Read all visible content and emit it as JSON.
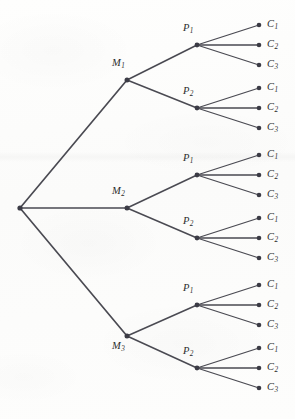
{
  "diagram": {
    "type": "probability-tree",
    "title": "",
    "background_color": "#fdfdfc",
    "line_color": "#4a4a52",
    "node_color": "#3b3b45",
    "label_color": "#2b2b2b",
    "levels": 3,
    "leaf_count": 18,
    "geometry": {
      "root": {
        "x": 20,
        "y": 208
      },
      "level_x": {
        "root": 20,
        "m": 127,
        "p": 197,
        "c": 259
      },
      "label_offset": {
        "c_label_x": 267
      }
    },
    "nodes": {
      "root": {
        "name": "root-node",
        "x": 20,
        "y": 208,
        "label": ""
      },
      "m_nodes": [
        {
          "name": "node-m1",
          "base": "M",
          "sub": "1",
          "x": 127,
          "y": 80,
          "label_x": 112,
          "label_y": 57,
          "label_pos": "above-left"
        },
        {
          "name": "node-m2",
          "base": "M",
          "sub": "2",
          "x": 127,
          "y": 208,
          "label_x": 112,
          "label_y": 185,
          "label_pos": "above-left"
        },
        {
          "name": "node-m3",
          "base": "M",
          "sub": "3",
          "x": 127,
          "y": 336,
          "label_x": 112,
          "label_y": 340,
          "label_pos": "below-left"
        }
      ],
      "p_nodes": [
        {
          "name": "node-m1-p1",
          "base": "P",
          "sub": "1",
          "x": 197,
          "y": 45,
          "parent": "node-m1",
          "label_x": 183,
          "label_y": 22
        },
        {
          "name": "node-m1-p2",
          "base": "P",
          "sub": "2",
          "x": 197,
          "y": 108,
          "parent": "node-m1",
          "label_x": 183,
          "label_y": 85
        },
        {
          "name": "node-m2-p1",
          "base": "P",
          "sub": "1",
          "x": 197,
          "y": 175,
          "parent": "node-m2",
          "label_x": 183,
          "label_y": 152
        },
        {
          "name": "node-m2-p2",
          "base": "P",
          "sub": "2",
          "x": 197,
          "y": 238,
          "parent": "node-m2",
          "label_x": 183,
          "label_y": 215
        },
        {
          "name": "node-m3-p1",
          "base": "P",
          "sub": "1",
          "x": 197,
          "y": 305,
          "parent": "node-m3",
          "label_x": 183,
          "label_y": 282
        },
        {
          "name": "node-m3-p2",
          "base": "P",
          "sub": "2",
          "x": 197,
          "y": 368,
          "parent": "node-m3",
          "label_x": 183,
          "label_y": 345
        }
      ],
      "c_nodes": [
        {
          "name": "leaf-m1-p1-c1",
          "base": "C",
          "sub": "1",
          "x": 259,
          "y": 25,
          "parent": "node-m1-p1"
        },
        {
          "name": "leaf-m1-p1-c2",
          "base": "C",
          "sub": "2",
          "x": 259,
          "y": 45,
          "parent": "node-m1-p1"
        },
        {
          "name": "leaf-m1-p1-c3",
          "base": "C",
          "sub": "3",
          "x": 259,
          "y": 65,
          "parent": "node-m1-p1"
        },
        {
          "name": "leaf-m1-p2-c1",
          "base": "C",
          "sub": "1",
          "x": 259,
          "y": 88,
          "parent": "node-m1-p2"
        },
        {
          "name": "leaf-m1-p2-c2",
          "base": "C",
          "sub": "2",
          "x": 259,
          "y": 108,
          "parent": "node-m1-p2"
        },
        {
          "name": "leaf-m1-p2-c3",
          "base": "C",
          "sub": "3",
          "x": 259,
          "y": 128,
          "parent": "node-m1-p2"
        },
        {
          "name": "leaf-m2-p1-c1",
          "base": "C",
          "sub": "1",
          "x": 259,
          "y": 155,
          "parent": "node-m2-p1"
        },
        {
          "name": "leaf-m2-p1-c2",
          "base": "C",
          "sub": "2",
          "x": 259,
          "y": 175,
          "parent": "node-m2-p1"
        },
        {
          "name": "leaf-m2-p1-c3",
          "base": "C",
          "sub": "3",
          "x": 259,
          "y": 195,
          "parent": "node-m2-p1"
        },
        {
          "name": "leaf-m2-p2-c1",
          "base": "C",
          "sub": "1",
          "x": 259,
          "y": 218,
          "parent": "node-m2-p2"
        },
        {
          "name": "leaf-m2-p2-c2",
          "base": "C",
          "sub": "2",
          "x": 259,
          "y": 238,
          "parent": "node-m2-p2"
        },
        {
          "name": "leaf-m2-p2-c3",
          "base": "C",
          "sub": "3",
          "x": 259,
          "y": 258,
          "parent": "node-m2-p2"
        },
        {
          "name": "leaf-m3-p1-c1",
          "base": "C",
          "sub": "1",
          "x": 259,
          "y": 285,
          "parent": "node-m3-p1"
        },
        {
          "name": "leaf-m3-p1-c2",
          "base": "C",
          "sub": "2",
          "x": 259,
          "y": 305,
          "parent": "node-m3-p1"
        },
        {
          "name": "leaf-m3-p1-c3",
          "base": "C",
          "sub": "3",
          "x": 259,
          "y": 325,
          "parent": "node-m3-p1"
        },
        {
          "name": "leaf-m3-p2-c1",
          "base": "C",
          "sub": "1",
          "x": 259,
          "y": 348,
          "parent": "node-m3-p2"
        },
        {
          "name": "leaf-m3-p2-c2",
          "base": "C",
          "sub": "2",
          "x": 259,
          "y": 368,
          "parent": "node-m3-p2"
        },
        {
          "name": "leaf-m3-p2-c3",
          "base": "C",
          "sub": "3",
          "x": 259,
          "y": 388,
          "parent": "node-m3-p2"
        }
      ]
    }
  }
}
